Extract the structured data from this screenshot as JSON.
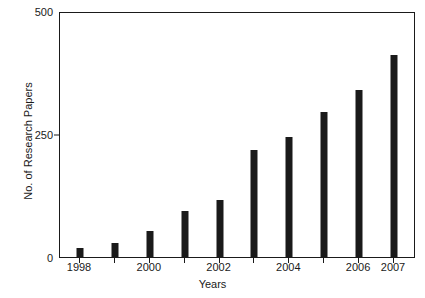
{
  "chart_data": {
    "type": "bar",
    "title": "",
    "xlabel": "Years",
    "ylabel": "No. of Research Papers",
    "categories": [
      "1998",
      "1999",
      "2000",
      "2001",
      "2002",
      "2003",
      "2004",
      "2005",
      "2006",
      "2007"
    ],
    "values": [
      18,
      28,
      53,
      93,
      116,
      218,
      244,
      295,
      340,
      410
    ],
    "x_tick_labels": [
      "1998",
      "",
      "2000",
      "",
      "2002",
      "",
      "2004",
      "",
      "2006",
      "2007"
    ],
    "y_ticks": [
      0,
      250,
      500
    ],
    "y_tick_labels": [
      "0",
      "250",
      "500"
    ],
    "ylim": [
      0,
      500
    ],
    "grid": false,
    "legend": null,
    "bar_color": "#1a1a1a",
    "axis_color": "#1a1a1a",
    "background_color": "#ffffff"
  }
}
